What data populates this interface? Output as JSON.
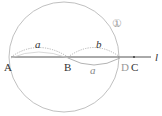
{
  "diagram": {
    "circle_label": "①",
    "line_label": "l",
    "points": {
      "A": "A",
      "B": "B",
      "C": "C",
      "D": "D"
    },
    "arcs": {
      "AB_top": "a",
      "BD_top": "b",
      "BD_bottom": "a"
    },
    "colors": {
      "line": "#555555",
      "circle": "#b0b0b0",
      "arc": "#999999"
    }
  }
}
